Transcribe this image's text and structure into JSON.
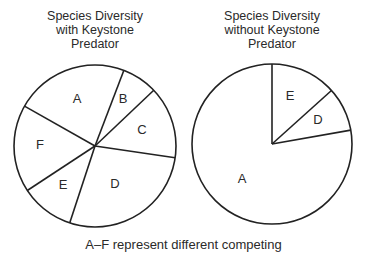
{
  "chart_data": [
    {
      "type": "pie",
      "title": "Species Diversity\nwith Keystone\nPredator",
      "start_angle_deg": -60.5,
      "direction": "clockwise",
      "categories": [
        "A",
        "B",
        "C",
        "D",
        "E",
        "F"
      ],
      "values": [
        81.4,
        25.6,
        51.9,
        99.8,
        38.5,
        62.8
      ],
      "units": "degrees (approx. share of circle)",
      "percent": [
        22.6,
        7.1,
        14.4,
        27.7,
        10.7,
        17.4
      ],
      "center": [
        95,
        146
      ],
      "radius": 81,
      "label_positions": [
        [
          77,
          100
        ],
        [
          123,
          100
        ],
        [
          142,
          131
        ],
        [
          115,
          185
        ],
        [
          63,
          186
        ],
        [
          40,
          146
        ]
      ]
    },
    {
      "type": "pie",
      "title": "Species Diversity\nwithout Keystone\nPredator",
      "start_angle_deg": 0,
      "direction": "clockwise",
      "categories": [
        "E",
        "D",
        "A"
      ],
      "values": [
        48,
        32,
        280
      ],
      "units": "degrees (approx. share of circle)",
      "percent": [
        13.3,
        8.9,
        77.8
      ],
      "center": [
        272,
        144
      ],
      "radius": 80,
      "label_positions": [
        [
          290,
          97
        ],
        [
          318,
          121
        ],
        [
          242,
          180
        ]
      ]
    }
  ],
  "caption": "A–F represent different competing",
  "colors": {
    "stroke": "#222222",
    "fill": "#ffffff",
    "text": "#2a2a2a"
  }
}
